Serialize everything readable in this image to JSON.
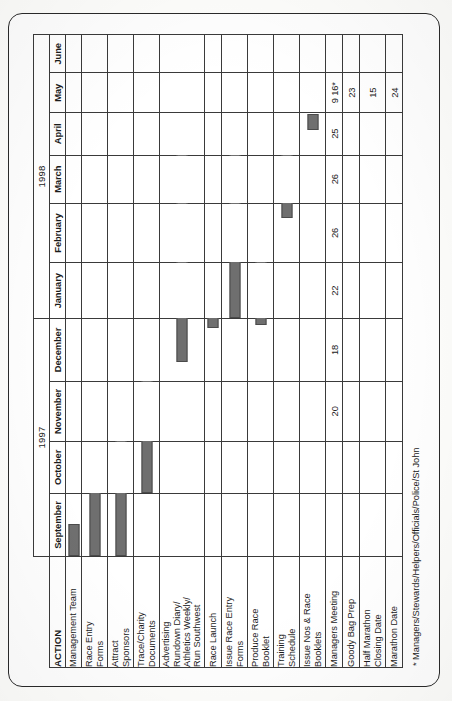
{
  "document": {
    "type": "gantt-chart",
    "footnote": "* Managers/Stewards/Helpers/Officials/Police/St John"
  },
  "header": {
    "action_label": "ACTION",
    "years": [
      {
        "label": "1997",
        "span": 4
      },
      {
        "label": "1998",
        "span": 6
      }
    ],
    "months": [
      "September",
      "October",
      "November",
      "December",
      "January",
      "February",
      "March",
      "April",
      "May",
      "June"
    ]
  },
  "chart_data": {
    "type": "bar",
    "title": "",
    "xlabel": "",
    "ylabel": "ACTION",
    "categories": [
      "Management Team",
      "Race Entry\nForms",
      "Attract\nSponsors",
      "Trace/Charity\nDocuments",
      "Advertising\nRundown Diary/\nAthletics Weekly/\nRun Southwest",
      "Race Launch",
      "Issue Race Entry\nForms",
      "Produce Race\nBooklet",
      "Training\nSchedule",
      "Issue Nos & Race\nBooklets",
      "Managers Meeting",
      "Goody Bag Prep",
      "Half Marathon\nClosing Date",
      "Marathon Date"
    ],
    "x": [
      "September",
      "October",
      "November",
      "December",
      "January",
      "February",
      "March",
      "April",
      "May",
      "June"
    ],
    "tasks": [
      {
        "name": "Management Team",
        "start_month": "September",
        "end_month": "September",
        "start_frac": 0.0,
        "end_frac": 0.55,
        "marks": []
      },
      {
        "name": "Race Entry Forms",
        "start_month": "September",
        "end_month": "October",
        "start_frac": 0.0,
        "end_frac": 1.5,
        "marks": []
      },
      {
        "name": "Attract Sponsors",
        "start_month": "September",
        "end_month": "November",
        "start_frac": 0.0,
        "end_frac": 2.35,
        "marks": []
      },
      {
        "name": "Trace/Charity Documents",
        "start_month": "October",
        "end_month": "December",
        "start_frac": 0.0,
        "end_frac": 2.2,
        "marks": []
      },
      {
        "name": "Advertising Rundown Diary/Athletics Weekly/Run Southwest",
        "start_month": "December",
        "end_month": "April",
        "start_frac": 0.32,
        "end_frac": 4.45,
        "marks": []
      },
      {
        "name": "Race Launch",
        "start_month": "December",
        "end_month": "January",
        "start_frac": 0.9,
        "end_frac": 1.3,
        "marks": []
      },
      {
        "name": "Issue Race Entry Forms",
        "start_month": "January",
        "end_month": "May",
        "start_frac": 0.0,
        "end_frac": 4.1,
        "marks": []
      },
      {
        "name": "Produce Race Booklet",
        "start_month": "December",
        "end_month": "February",
        "start_frac": 0.95,
        "end_frac": 2.75,
        "marks": []
      },
      {
        "name": "Training Schedule",
        "start_month": "February",
        "end_month": "May",
        "start_frac": 0.8,
        "end_frac": 3.1,
        "marks": []
      },
      {
        "name": "Issue Nos & Race Booklets",
        "start_month": "April",
        "end_month": "April",
        "start_frac": 0.62,
        "end_frac": 1.02,
        "marks": []
      },
      {
        "name": "Managers Meeting",
        "start_month": "",
        "end_month": "",
        "start_frac": 0,
        "end_frac": 0,
        "marks": []
      },
      {
        "name": "Goody Bag Prep",
        "start_month": "",
        "end_month": "",
        "start_frac": 0,
        "end_frac": 0,
        "marks": []
      },
      {
        "name": "Half Marathon Closing Date",
        "start_month": "",
        "end_month": "",
        "start_frac": 0,
        "end_frac": 0,
        "marks": []
      },
      {
        "name": "Marathon Date",
        "start_month": "",
        "end_month": "",
        "start_frac": 0,
        "end_frac": 0,
        "marks": []
      }
    ],
    "date_markers": {
      "Managers Meeting": {
        "November": "20",
        "December": "18",
        "January": "22",
        "February": "26",
        "March": "26",
        "April": "25",
        "May": "9 16*"
      },
      "Goody Bag Prep": {
        "May": "23"
      },
      "Half Marathon Closing Date": {
        "May": "15"
      },
      "Marathon Date": {
        "May": "24"
      }
    },
    "bar_color": "#6f6f6f",
    "grid": true,
    "legend": "none"
  }
}
